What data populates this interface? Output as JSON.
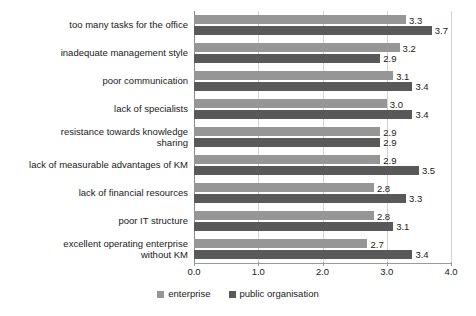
{
  "chart_data": {
    "type": "bar",
    "orientation": "horizontal",
    "title": "",
    "xlabel": "",
    "ylabel": "",
    "xlim": [
      0.0,
      4.0
    ],
    "xticks": [
      "0.0",
      "1.0",
      "2.0",
      "3.0",
      "4.0"
    ],
    "xtick_values": [
      0.0,
      1.0,
      2.0,
      3.0,
      4.0
    ],
    "grid": true,
    "grid_axis": "x",
    "legend_position": "bottom",
    "categories": [
      "too many tasks for the office",
      "inadequate management style",
      "poor communication",
      "lack of specialists",
      "resistance towards knowledge\nsharing",
      "lack of measurable advantages of KM",
      "lack of financial resources",
      "poor IT structure",
      "excellent operating enterprise\nwithout KM"
    ],
    "series": [
      {
        "name": "enterprise",
        "color": "#969696",
        "values": [
          3.3,
          3.2,
          3.1,
          3.0,
          2.9,
          2.9,
          2.8,
          2.8,
          2.7
        ],
        "labels": [
          "3.3",
          "3.2",
          "3.1",
          "3.0",
          "2.9",
          "2.9",
          "2.8",
          "2.8",
          "2.7"
        ]
      },
      {
        "name": "public organisation",
        "color": "#595959",
        "values": [
          3.7,
          2.9,
          3.4,
          3.4,
          2.9,
          3.5,
          3.3,
          3.1,
          3.4
        ],
        "labels": [
          "3.7",
          "2.9",
          "3.4",
          "3.4",
          "2.9",
          "3.5",
          "3.3",
          "3.1",
          "3.4"
        ]
      }
    ]
  },
  "legend": {
    "items": [
      {
        "label": "enterprise",
        "color": "#969696"
      },
      {
        "label": "public organisation",
        "color": "#595959"
      }
    ]
  },
  "colors": {
    "enterprise": "#969696",
    "public_organisation": "#595959",
    "gridline": "#d4d4d4",
    "axis": "#8a8a8a",
    "text": "#1a1a1a",
    "background": "#ffffff"
  }
}
